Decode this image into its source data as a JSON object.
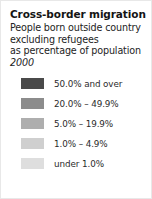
{
  "card": {
    "title": "Cross-border migration",
    "subtitle_lines": [
      "People born outside country",
      "excluding refugees",
      "as percentage of population"
    ],
    "year": "2000",
    "background_color": "#ffffff",
    "border_color": "#e8e8e8",
    "title_color": "#141414",
    "text_color": "#232323"
  },
  "chart_data": {
    "type": "table",
    "title": "Cross-border migration",
    "subtitle": "People born outside country excluding refugees as percentage of population",
    "year": "2000",
    "legend_position": "left",
    "categories": [
      "50.0% and over",
      "20.0% – 49.9%",
      "5.0% – 19.9%",
      "1.0% – 4.9%",
      "under 1.0%"
    ],
    "colors": [
      "#4a4a4a",
      "#8c8c8c",
      "#aeaeae",
      "#cfcfcf",
      "#dedede"
    ],
    "bins": [
      {
        "label": "50.0% and over",
        "color": "#4a4a4a",
        "min": 50.0,
        "max": null
      },
      {
        "label": "20.0% – 49.9%",
        "color": "#8c8c8c",
        "min": 20.0,
        "max": 49.9
      },
      {
        "label": "5.0% – 19.9%",
        "color": "#aeaeae",
        "min": 5.0,
        "max": 19.9
      },
      {
        "label": "1.0% – 4.9%",
        "color": "#cfcfcf",
        "min": 1.0,
        "max": 4.9
      },
      {
        "label": "under 1.0%",
        "color": "#dedede",
        "min": null,
        "max": 1.0
      }
    ],
    "xlabel": "",
    "ylabel": "percentage of population"
  }
}
